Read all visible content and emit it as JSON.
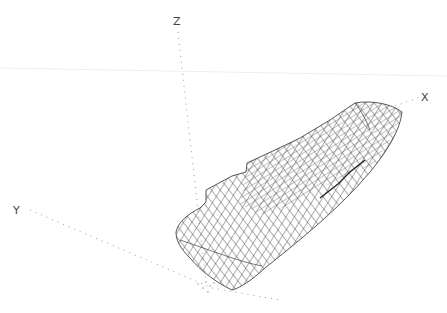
{
  "figure": {
    "type": "3D wireframe hull surface",
    "axes": {
      "x": {
        "label": "X"
      },
      "y": {
        "label": "Y"
      },
      "z": {
        "label": "Z"
      }
    },
    "colors": {
      "mesh": "#333333",
      "axis": "#999999",
      "label": "#444444",
      "background": "#ffffff"
    }
  }
}
